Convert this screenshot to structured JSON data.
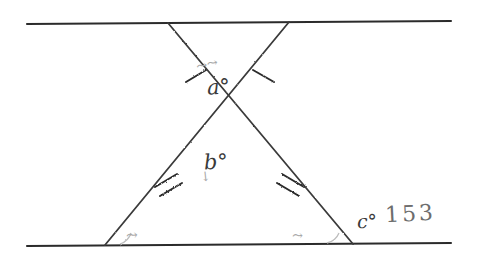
{
  "figure": {
    "type": "geometry-diagram",
    "background_color": "#ffffff",
    "ink_color": "#2b2b2b",
    "faint_ink_color": "#a9a9a9"
  },
  "labels": {
    "angle_a": "a°",
    "angle_b": "b°",
    "angle_c": "c°",
    "c_value": "153"
  },
  "scribbles": {
    "above_a": "⤳⤳",
    "below_b": "↓",
    "bottom_left": "⤳",
    "bottom_right": "⤳"
  },
  "geometry": {
    "top_line": {
      "x1": 27,
      "y1": 24,
      "x2": 451,
      "y2": 21
    },
    "bottom_line": {
      "x1": 27,
      "y1": 246,
      "x2": 451,
      "y2": 243
    },
    "apex": {
      "x": 228,
      "y": 132
    },
    "top_left_point": {
      "x": 168,
      "y": 23
    },
    "top_right_point": {
      "x": 289,
      "y": 22
    },
    "bottom_left_point": {
      "x": 105,
      "y": 245
    },
    "bottom_right_point": {
      "x": 353,
      "y": 244
    }
  },
  "tick_marks": {
    "upper_left": {
      "x": 196,
      "y": 76,
      "count": 1
    },
    "upper_right": {
      "x": 263,
      "y": 76,
      "count": 1
    },
    "lower_left": {
      "x": 167,
      "y": 186,
      "count": 2
    },
    "lower_right": {
      "x": 292,
      "y": 186,
      "count": 2
    }
  }
}
